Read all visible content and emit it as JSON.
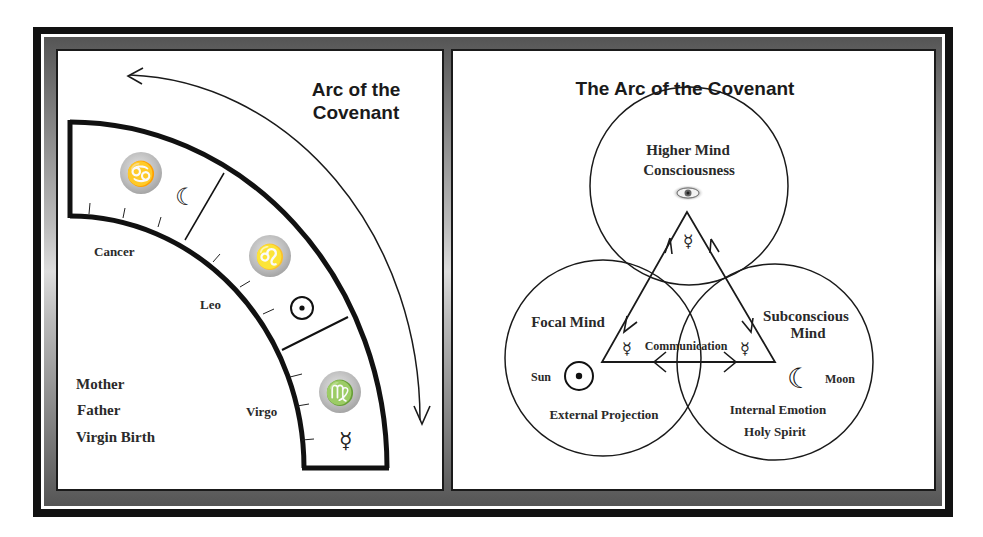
{
  "left_panel": {
    "title_line1": "Arc of the",
    "title_line2": "Covenant",
    "signs": [
      {
        "name": "Cancer",
        "glyph": "♋",
        "ruler_glyph": "☾",
        "ruler": "moon"
      },
      {
        "name": "Leo",
        "glyph": "♌",
        "ruler_glyph": "☉",
        "ruler": "sun"
      },
      {
        "name": "Virgo",
        "glyph": "♍",
        "ruler_glyph": "☿",
        "ruler": "mercury"
      }
    ],
    "labels": {
      "cancer": "Cancer",
      "leo": "Leo",
      "virgo": "Virgo"
    },
    "trinity": [
      "Mother",
      "Father",
      "Virgin Birth"
    ]
  },
  "right_panel": {
    "title": "The Arc of the Covenant",
    "higher_mind": {
      "line1": "Higher Mind",
      "line2": "Consciousness",
      "symbol": "eye"
    },
    "focal_mind": {
      "label": "Focal Mind",
      "planet": "Sun",
      "planet_glyph": "☉",
      "caption": "External Projection"
    },
    "subconscious_mind": {
      "line1": "Subconscious",
      "line2": "Mind",
      "planet": "Moon",
      "planet_glyph": "☾",
      "caption_line1": "Internal Emotion",
      "caption_line2": "Holy Spirit"
    },
    "communication": {
      "label": "Communication",
      "glyph": "☿"
    },
    "mercury_glyph": "☿"
  },
  "colors": {
    "ink": "#1a1a1a",
    "frame": "#111111",
    "badge": "#bdbdbd"
  }
}
